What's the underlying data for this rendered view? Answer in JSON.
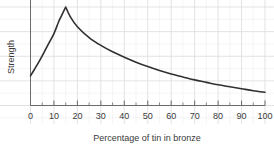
{
  "chart_data": {
    "type": "line",
    "title": "",
    "xlabel": "Percentage of tin in bronze",
    "ylabel": "Strength",
    "xlim": [
      0,
      100
    ],
    "ylim": [
      0,
      1.08
    ],
    "grid": true,
    "grid_color": "#dcdcdc",
    "legend": "none",
    "line_color": "#332f2f",
    "axis_color": "#6b6b6b",
    "xticks": [
      0,
      10,
      20,
      30,
      40,
      50,
      60,
      70,
      80,
      90,
      100
    ],
    "xtick_labels": [
      "0",
      "10",
      "20",
      "30",
      "40",
      "50",
      "60",
      "70",
      "80",
      "90",
      "100"
    ],
    "x_minor_tick_step": 5,
    "yticks": [],
    "ytick_labels": [],
    "annotations": [],
    "series": [
      {
        "name": "Strength of bronze vs tin percentage",
        "x": [
          0,
          2,
          4,
          6,
          8,
          10,
          12,
          13,
          14,
          15,
          17,
          20,
          25,
          30,
          35,
          40,
          45,
          50,
          55,
          60,
          65,
          70,
          75,
          80,
          85,
          90,
          95,
          100
        ],
        "values": [
          0.3,
          0.38,
          0.46,
          0.55,
          0.64,
          0.73,
          0.85,
          0.9,
          0.95,
          1.0,
          0.9,
          0.8,
          0.69,
          0.61,
          0.545,
          0.49,
          0.44,
          0.395,
          0.355,
          0.32,
          0.29,
          0.26,
          0.235,
          0.21,
          0.19,
          0.17,
          0.15,
          0.135
        ]
      }
    ],
    "peak": {
      "x": 15,
      "y": 1.0
    }
  },
  "axis": {
    "x_title": "Percentage of tin in bronze",
    "y_title": "Strength"
  }
}
